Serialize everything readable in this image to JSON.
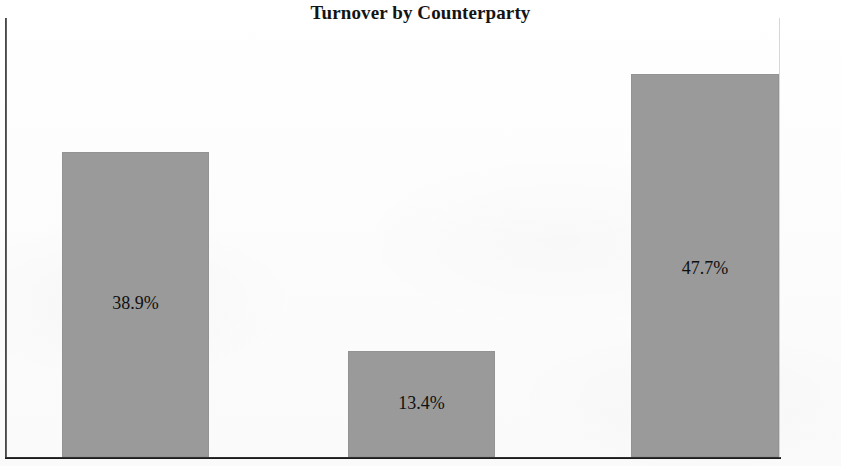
{
  "chart_data": {
    "type": "bar",
    "title": "Turnover by Counterparty",
    "xlabel": "",
    "ylabel": "",
    "categories": [
      "",
      "",
      ""
    ],
    "values": [
      38.9,
      13.4,
      47.7
    ],
    "data_labels": [
      "38.9%",
      "13.4%",
      "47.7%"
    ],
    "ylim": [
      0,
      55
    ],
    "grid": false,
    "legend": false,
    "units": "percent",
    "series": [
      {
        "name": "Turnover share",
        "values": [
          38.9,
          13.4,
          47.7
        ]
      }
    ],
    "bar_color": "#9a9a9a",
    "axis_color": "#2b2b2b",
    "background": "#fdfdfd"
  },
  "chart": {
    "title": "Turnover by Counterparty",
    "bars": [
      {
        "label": "38.9%",
        "value": 38.9,
        "left_px": 57,
        "width_px": 147,
        "top_px": 134,
        "height_px": 305,
        "label_top_px": 275
      },
      {
        "label": "13.4%",
        "value": 13.4,
        "left_px": 343,
        "width_px": 147,
        "top_px": 333,
        "height_px": 106,
        "label_top_px": 375
      },
      {
        "label": "47.7%",
        "value": 47.7,
        "left_px": 626,
        "width_px": 148,
        "top_px": 56,
        "height_px": 383,
        "label_top_px": 240
      }
    ]
  }
}
